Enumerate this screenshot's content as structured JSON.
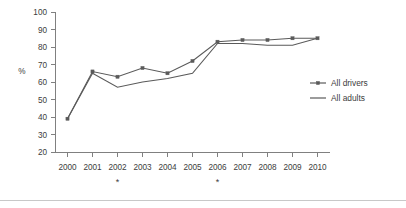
{
  "chart_data": {
    "type": "line",
    "title": "",
    "xlabel": "",
    "ylabel": "%",
    "ylim": [
      20,
      100
    ],
    "ytick_values": [
      20,
      30,
      40,
      50,
      60,
      70,
      80,
      90,
      100
    ],
    "ytick_labels": [
      "20",
      "30",
      "40",
      "50",
      "60",
      "70",
      "80",
      "90",
      "100"
    ],
    "grid": false,
    "legend_position": "right",
    "categories": [
      "2000",
      "2001",
      "2002",
      "2003",
      "2004",
      "2005",
      "2006",
      "2007",
      "2008",
      "2009",
      "2010"
    ],
    "x": [
      2000,
      2001,
      2002,
      2003,
      2004,
      2005,
      2006,
      2007,
      2008,
      2009,
      2010
    ],
    "series": [
      {
        "name": "All drivers",
        "marker": "square",
        "values": [
          39,
          66,
          63,
          68,
          65,
          72,
          83,
          84,
          84,
          85,
          85
        ]
      },
      {
        "name": "All adults",
        "marker": "none",
        "values": [
          39,
          65,
          57,
          60,
          62,
          65,
          82,
          82,
          81,
          81,
          85
        ]
      }
    ],
    "annotations": [
      {
        "text": "*",
        "x_category": "2002",
        "position": "below-axis"
      },
      {
        "text": "*",
        "x_category": "2006",
        "position": "below-axis"
      }
    ]
  },
  "legend": {
    "entries": [
      {
        "label": "All drivers",
        "marker": "square-line"
      },
      {
        "label": "All adults",
        "marker": "line"
      }
    ]
  },
  "colors": {
    "series_line": "#5a5a5a",
    "axis": "#808080",
    "text": "#3c3c3c",
    "background": "#ffffff",
    "rule": "#c8c8c8"
  }
}
